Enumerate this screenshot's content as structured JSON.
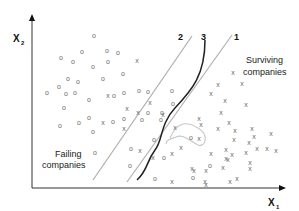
{
  "diagram": {
    "axes": {
      "x_label": "X",
      "x_sub": "1",
      "y_label": "X",
      "y_sub": "2"
    },
    "regions": {
      "left_label_line1": "Failing",
      "left_label_line2": "companies",
      "right_label_line1": "Surviving",
      "right_label_line2": "companies"
    },
    "boundaries": [
      {
        "id": "1",
        "label": "1",
        "type": "straight line",
        "color": "#b0b0b0"
      },
      {
        "id": "2",
        "label": "2",
        "type": "straight line",
        "color": "#b0b0b0"
      },
      {
        "id": "3",
        "label": "3",
        "type": "curved line",
        "color": "#222222"
      }
    ],
    "loop_color": "#c8c8c8",
    "marker_o": "o",
    "marker_x": "x",
    "points_o": [
      [
        94,
        35
      ],
      [
        61,
        57
      ],
      [
        82,
        51
      ],
      [
        107,
        50
      ],
      [
        118,
        52
      ],
      [
        73,
        61
      ],
      [
        93,
        66
      ],
      [
        108,
        61
      ],
      [
        123,
        73
      ],
      [
        68,
        78
      ],
      [
        78,
        81
      ],
      [
        103,
        78
      ],
      [
        59,
        86
      ],
      [
        47,
        92
      ],
      [
        66,
        93
      ],
      [
        75,
        92
      ],
      [
        89,
        99
      ],
      [
        114,
        95
      ],
      [
        124,
        92
      ],
      [
        139,
        90
      ],
      [
        64,
        107
      ],
      [
        89,
        117
      ],
      [
        60,
        125
      ],
      [
        79,
        122
      ],
      [
        93,
        131
      ],
      [
        113,
        121
      ],
      [
        124,
        118
      ],
      [
        148,
        91
      ],
      [
        172,
        90
      ],
      [
        173,
        103
      ],
      [
        148,
        112
      ],
      [
        162,
        112
      ],
      [
        95,
        152
      ],
      [
        130,
        165
      ],
      [
        142,
        119
      ],
      [
        161,
        119
      ],
      [
        154,
        139
      ],
      [
        191,
        137
      ],
      [
        131,
        148
      ],
      [
        164,
        157
      ],
      [
        155,
        178
      ],
      [
        210,
        165
      ],
      [
        193,
        177
      ]
    ],
    "points_x": [
      [
        137,
        60
      ],
      [
        150,
        102
      ],
      [
        108,
        95
      ],
      [
        127,
        108
      ],
      [
        103,
        122
      ],
      [
        124,
        128
      ],
      [
        140,
        150
      ],
      [
        138,
        112
      ],
      [
        163,
        114
      ],
      [
        153,
        157
      ],
      [
        172,
        153
      ],
      [
        181,
        147
      ],
      [
        199,
        138
      ],
      [
        226,
        158
      ],
      [
        218,
        84
      ],
      [
        233,
        72
      ],
      [
        211,
        93
      ],
      [
        225,
        100
      ],
      [
        242,
        83
      ],
      [
        221,
        112
      ],
      [
        199,
        118
      ],
      [
        246,
        104
      ],
      [
        175,
        127
      ],
      [
        201,
        124
      ],
      [
        218,
        128
      ],
      [
        235,
        130
      ],
      [
        229,
        122
      ],
      [
        252,
        128
      ],
      [
        234,
        139
      ],
      [
        254,
        136
      ],
      [
        271,
        133
      ],
      [
        257,
        148
      ],
      [
        249,
        142
      ],
      [
        226,
        149
      ],
      [
        194,
        170
      ],
      [
        206,
        170
      ],
      [
        223,
        167
      ],
      [
        211,
        153
      ],
      [
        232,
        154
      ],
      [
        250,
        168
      ],
      [
        267,
        148
      ],
      [
        276,
        150
      ],
      [
        228,
        159
      ],
      [
        246,
        152
      ],
      [
        172,
        181
      ],
      [
        205,
        181
      ],
      [
        192,
        168
      ],
      [
        237,
        178
      ],
      [
        206,
        184
      ],
      [
        250,
        162
      ],
      [
        230,
        181
      ]
    ]
  }
}
